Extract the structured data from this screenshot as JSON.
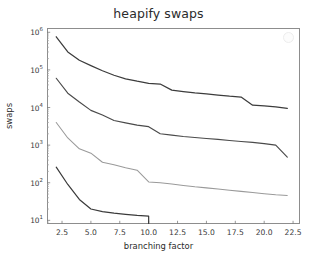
{
  "chart_data": {
    "type": "line",
    "title": "heapify swaps",
    "xlabel": "branching factor",
    "ylabel": "swaps",
    "xscale": "linear",
    "yscale": "log",
    "xlim": [
      1.2,
      23.1
    ],
    "ylim": [
      8,
      1300000
    ],
    "grid": false,
    "legend": "none",
    "xticks": [
      "2.5",
      "5.0",
      "7.5",
      "10.0",
      "12.5",
      "15.0",
      "17.5",
      "20.0",
      "22.5"
    ],
    "xtick_values": [
      2.5,
      5.0,
      7.5,
      10.0,
      12.5,
      15.0,
      17.5,
      20.0,
      22.5
    ],
    "yticks": [
      "10^1",
      "10^2",
      "10^3",
      "10^4",
      "10^5",
      "10^6"
    ],
    "ytick_values": [
      10,
      100,
      1000,
      10000,
      100000,
      1000000
    ],
    "ytick_mantissa": [
      "10",
      "10",
      "10",
      "10",
      "10",
      "10"
    ],
    "ytick_exponent": [
      "1",
      "2",
      "3",
      "4",
      "5",
      "6"
    ],
    "series": [
      {
        "name": "series-1",
        "color": "#3c3c3c",
        "linewidth": 1.25,
        "x": [
          2,
          3,
          4,
          5,
          6,
          7,
          8,
          9,
          10,
          11,
          12,
          13,
          14,
          15,
          16,
          17,
          18,
          19,
          20,
          21,
          22
        ],
        "values": [
          760000,
          300000,
          180000,
          130000,
          95000,
          72000,
          58000,
          50000,
          44000,
          42000,
          29000,
          26500,
          24500,
          23000,
          21500,
          20000,
          19000,
          11500,
          11000,
          10400,
          9500
        ]
      },
      {
        "name": "series-2",
        "color": "#4a4a4a",
        "linewidth": 1.15,
        "x": [
          2,
          3,
          4,
          5,
          6,
          7,
          8,
          9,
          10,
          11,
          12,
          13,
          14,
          15,
          16,
          17,
          18,
          19,
          20,
          21,
          22
        ],
        "values": [
          60000,
          24000,
          14000,
          8400,
          6300,
          4500,
          3900,
          3400,
          3100,
          2000,
          1850,
          1700,
          1600,
          1500,
          1420,
          1330,
          1250,
          1180,
          1100,
          1000,
          480
        ]
      },
      {
        "name": "series-3",
        "color": "#9a9a9a",
        "linewidth": 1.05,
        "x": [
          2,
          3,
          4,
          5,
          6,
          7,
          8,
          9,
          10,
          11,
          12,
          13,
          14,
          15,
          16,
          17,
          18,
          19,
          20,
          21,
          22
        ],
        "values": [
          4000,
          1550,
          800,
          610,
          350,
          300,
          250,
          215,
          105,
          100,
          92,
          85,
          78,
          73,
          68,
          63,
          59,
          55,
          51,
          48,
          46
        ]
      },
      {
        "name": "series-4",
        "color": "#3a3a3a",
        "linewidth": 1.2,
        "x": [
          2,
          3,
          4,
          5,
          6,
          7,
          8,
          9,
          10,
          10
        ],
        "values": [
          260,
          90,
          36,
          20,
          17,
          15.5,
          14.5,
          13.5,
          13,
          8.2
        ]
      }
    ]
  },
  "annotations": {
    "legend_marker": "legend-circle-marker"
  }
}
